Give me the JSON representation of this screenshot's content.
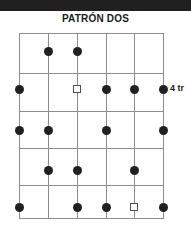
{
  "figure": {
    "title": "PATRÓN DOS",
    "side_label": "4 tr",
    "top_band_color": "#211f1f",
    "grid_line_color": "#8c8c8c",
    "dot_color": "#231f20",
    "square_outline_color": "#4d4d4d",
    "background_color": "#ffffff"
  },
  "chart_data": {
    "type": "scatter",
    "title": "PATRÓN DOS",
    "xlabel": "",
    "ylabel": "",
    "grid": true,
    "legend": null,
    "axis_ranges": {
      "x": [
        1,
        6
      ],
      "y": [
        1,
        5
      ]
    },
    "columns": [
      1,
      2,
      3,
      4,
      5,
      6
    ],
    "rows": [
      1,
      2,
      3,
      4,
      5
    ],
    "column_pixels": [
      19,
      48,
      77,
      106,
      134,
      163
    ],
    "row_pixels": [
      51,
      89,
      130,
      170,
      207
    ],
    "grid_rect_pixels": {
      "left": 19,
      "top": 33,
      "right": 163,
      "bottom": 218
    },
    "horizontal_line_pixels": [
      33,
      73,
      111,
      148,
      185,
      218
    ],
    "annotations": [
      {
        "text": "4 tr",
        "row": 2,
        "column": 6,
        "pixel_x": 170,
        "pixel_y": 89
      }
    ],
    "series": [
      {
        "name": "filled-dot",
        "marker": "filled-circle",
        "color": "#231f20",
        "points": [
          {
            "column": 2,
            "row": 1,
            "x": 48,
            "y": 51
          },
          {
            "column": 3,
            "row": 1,
            "x": 77,
            "y": 51
          },
          {
            "column": 1,
            "row": 2,
            "x": 19,
            "y": 89
          },
          {
            "column": 4,
            "row": 2,
            "x": 106,
            "y": 89
          },
          {
            "column": 5,
            "row": 2,
            "x": 134,
            "y": 89
          },
          {
            "column": 6,
            "row": 2,
            "x": 163,
            "y": 89
          },
          {
            "column": 1,
            "row": 3,
            "x": 19,
            "y": 130
          },
          {
            "column": 2,
            "row": 3,
            "x": 48,
            "y": 130
          },
          {
            "column": 4,
            "row": 3,
            "x": 106,
            "y": 130
          },
          {
            "column": 6,
            "row": 3,
            "x": 163,
            "y": 130
          },
          {
            "column": 2,
            "row": 4,
            "x": 48,
            "y": 170
          },
          {
            "column": 3,
            "row": 4,
            "x": 77,
            "y": 170
          },
          {
            "column": 5,
            "row": 4,
            "x": 134,
            "y": 170
          },
          {
            "column": 1,
            "row": 5,
            "x": 19,
            "y": 207
          },
          {
            "column": 3,
            "row": 5,
            "x": 77,
            "y": 207
          },
          {
            "column": 4,
            "row": 5,
            "x": 106,
            "y": 207
          },
          {
            "column": 6,
            "row": 5,
            "x": 163,
            "y": 207
          }
        ]
      },
      {
        "name": "open-square",
        "marker": "open-square",
        "color": "#4d4d4d",
        "points": [
          {
            "column": 3,
            "row": 2,
            "x": 77,
            "y": 89
          },
          {
            "column": 5,
            "row": 5,
            "x": 134,
            "y": 207
          }
        ]
      }
    ]
  }
}
